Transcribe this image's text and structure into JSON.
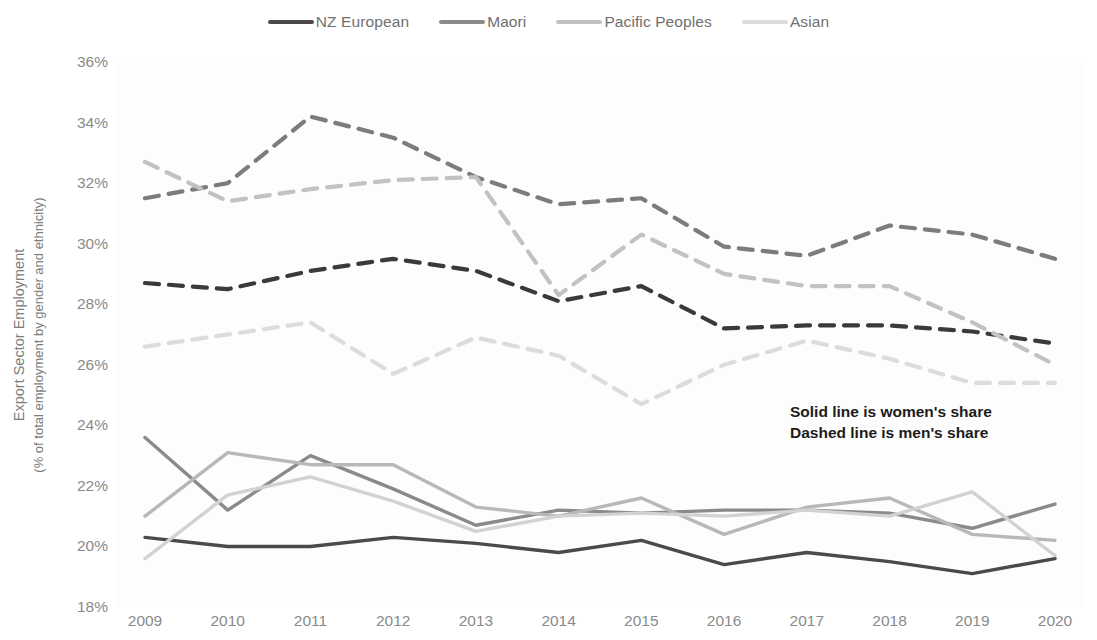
{
  "chart_data": {
    "type": "line",
    "title": "",
    "xlabel": "",
    "ylabel": "Export Sector Employment",
    "ylabel_line2": "(% of total employment by gender and ethnicity)",
    "categories": [
      "2009",
      "2010",
      "2011",
      "2012",
      "2013",
      "2014",
      "2015",
      "2016",
      "2017",
      "2018",
      "2019",
      "2020"
    ],
    "x": [
      2009,
      2010,
      2011,
      2012,
      2013,
      2014,
      2015,
      2016,
      2017,
      2018,
      2019,
      2020
    ],
    "ylim": [
      18,
      36
    ],
    "y_ticks": [
      "18%",
      "20%",
      "22%",
      "24%",
      "26%",
      "28%",
      "30%",
      "32%",
      "34%",
      "36%"
    ],
    "y_tick_values": [
      18,
      20,
      22,
      24,
      26,
      28,
      30,
      32,
      34,
      36
    ],
    "grid": false,
    "legend_position": "top-center",
    "legend": [
      "NZ European",
      "Maori",
      "Pacific Peoples",
      "Asian"
    ],
    "annotation": [
      "Solid line is women's share",
      "Dashed line is men's share"
    ],
    "series": [
      {
        "name": "NZ European",
        "gender": "women",
        "style": "solid",
        "color": "#4a4a4a",
        "values": [
          20.3,
          20.0,
          20.0,
          20.3,
          20.1,
          19.8,
          20.2,
          19.4,
          19.8,
          19.5,
          19.1,
          19.6
        ]
      },
      {
        "name": "Maori",
        "gender": "women",
        "style": "solid",
        "color": "#8a8a8a",
        "values": [
          23.6,
          21.2,
          23.0,
          21.9,
          20.7,
          21.2,
          21.1,
          21.2,
          21.2,
          21.1,
          20.6,
          21.4
        ]
      },
      {
        "name": "Pacific Peoples",
        "gender": "women",
        "style": "solid",
        "color": "#b8b8b8",
        "values": [
          21.0,
          23.1,
          22.7,
          22.7,
          21.3,
          21.0,
          21.6,
          20.4,
          21.3,
          21.6,
          20.4,
          20.2
        ]
      },
      {
        "name": "Asian",
        "gender": "women",
        "style": "solid",
        "color": "#d2d2d2",
        "values": [
          19.6,
          21.7,
          22.3,
          21.5,
          20.5,
          21.0,
          21.1,
          21.0,
          21.2,
          21.0,
          21.8,
          19.7
        ]
      },
      {
        "name": "NZ European",
        "gender": "men",
        "style": "dashed",
        "color": "#3a3a3a",
        "values": [
          28.7,
          28.5,
          29.1,
          29.5,
          29.1,
          28.1,
          28.6,
          27.2,
          27.3,
          27.3,
          27.1,
          26.7
        ]
      },
      {
        "name": "Maori",
        "gender": "men",
        "style": "dashed",
        "color": "#7c7c7c",
        "values": [
          31.5,
          32.0,
          34.2,
          33.5,
          32.2,
          31.3,
          31.5,
          29.9,
          29.6,
          30.6,
          30.3,
          29.5
        ]
      },
      {
        "name": "Pacific Peoples",
        "gender": "men",
        "style": "dashed",
        "color": "#c2c2c2",
        "values": [
          32.7,
          31.4,
          31.8,
          32.1,
          32.2,
          28.3,
          30.3,
          29.0,
          28.6,
          28.6,
          27.4,
          26.0
        ]
      },
      {
        "name": "Asian",
        "gender": "men",
        "style": "dashed",
        "color": "#dcdcdc",
        "values": [
          26.6,
          27.0,
          27.4,
          25.7,
          26.9,
          26.3,
          24.7,
          26.0,
          26.8,
          26.2,
          25.4,
          25.4
        ]
      }
    ]
  },
  "legend_items": [
    {
      "label": "NZ European",
      "color": "#4a4a4a"
    },
    {
      "label": "Maori",
      "color": "#8a8a8a"
    },
    {
      "label": "Pacific Peoples",
      "color": "#c0c0c0"
    },
    {
      "label": "Asian",
      "color": "#dcdcdc"
    }
  ],
  "annotation": {
    "line1": "Solid line is women's share",
    "line2": "Dashed line is men's share"
  },
  "axis": {
    "y_title_line1": "Export Sector Employment",
    "y_title_line2": "(% of total employment by gender and ethnicity)"
  }
}
